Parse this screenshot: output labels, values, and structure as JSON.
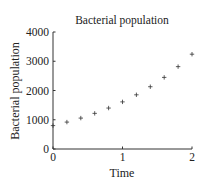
{
  "chart_data": {
    "type": "scatter",
    "title": "Bacterial population",
    "xlabel": "Time",
    "ylabel": "Bacterial population",
    "xlim": [
      0,
      2
    ],
    "ylim": [
      0,
      4000
    ],
    "xticks": [
      0,
      1,
      2
    ],
    "xtick_labels": [
      "0",
      "1",
      "2"
    ],
    "yticks": [
      0,
      1000,
      2000,
      3000,
      4000
    ],
    "ytick_labels": [
      "0",
      "1000",
      "2000",
      "3000",
      "4000"
    ],
    "grid": false,
    "legend": null,
    "marker": "+",
    "series": [
      {
        "name": "Bacterial population",
        "x": [
          0,
          0.2,
          0.4,
          0.6,
          0.8,
          1.0,
          1.2,
          1.4,
          1.6,
          1.8,
          2.0
        ],
        "y": [
          800,
          920,
          1057,
          1218,
          1400,
          1611,
          1853,
          2129,
          2448,
          2816,
          3241
        ]
      }
    ]
  },
  "colors": {
    "marker": "#333333",
    "axis": "#333333",
    "text": "#222222"
  }
}
